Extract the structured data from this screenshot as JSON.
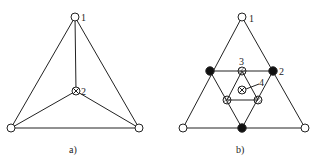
{
  "diagrams": [
    {
      "caption": "a)",
      "node_labels": {
        "n1": "1",
        "n2": "2"
      }
    },
    {
      "caption": "b)",
      "node_labels": {
        "n1": "1",
        "n2": "2",
        "n3": "3",
        "n4": "4"
      }
    }
  ],
  "colors": {
    "stroke": "#222222",
    "background": "#ffffff",
    "fill_black": "#111111"
  }
}
